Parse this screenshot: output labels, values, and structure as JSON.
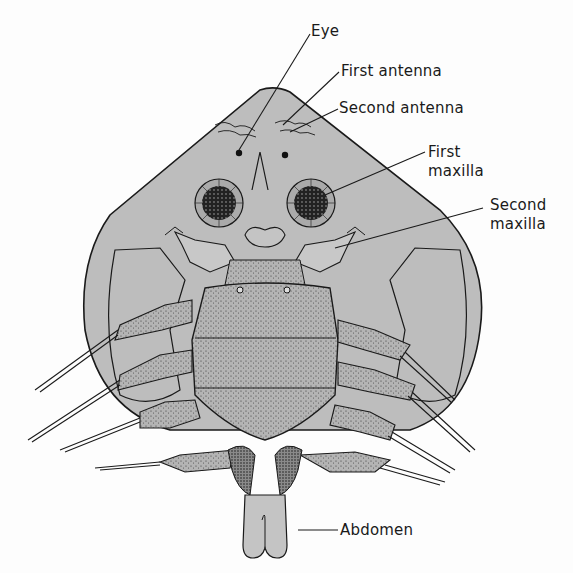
{
  "figure": {
    "colors": {
      "background": "#fdfdfd",
      "carapace_fill": "#bdbdbd",
      "stipple_fill": "#a8a8a8",
      "dark_fill": "#6e6e6e",
      "outline": "#1a1a1a"
    }
  },
  "labels": {
    "eye": "Eye",
    "first_antenna": "First antenna",
    "second_antenna": "Second antenna",
    "first_maxilla_line1": "First",
    "first_maxilla_line2": "maxilla",
    "second_maxilla_line1": "Second",
    "second_maxilla_line2": "maxilla",
    "abdomen": "Abdomen"
  }
}
